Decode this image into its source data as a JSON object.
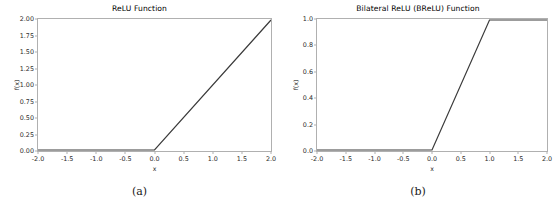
{
  "figure": {
    "background": "#ffffff",
    "line_color": "#3a3a3a",
    "axis_color": "#b0b0b0"
  },
  "panels": [
    {
      "caption": "(a)",
      "chart_data": {
        "type": "line",
        "title": "ReLU Function",
        "xlabel": "x",
        "ylabel": "f(x)",
        "xlim": [
          -2.0,
          2.0
        ],
        "ylim": [
          0.0,
          2.0
        ],
        "grid": false,
        "legend": "none",
        "xticks": [
          "-2.0",
          "-1.5",
          "-1.0",
          "-0.5",
          "0.0",
          "0.5",
          "1.0",
          "1.5",
          "2.0"
        ],
        "xtick_values": [
          -2.0,
          -1.5,
          -1.0,
          -0.5,
          0.0,
          0.5,
          1.0,
          1.5,
          2.0
        ],
        "yticks": [
          "0.00",
          "0.25",
          "0.50",
          "0.75",
          "1.00",
          "1.25",
          "1.50",
          "1.75",
          "2.00"
        ],
        "ytick_values": [
          0.0,
          0.25,
          0.5,
          0.75,
          1.0,
          1.25,
          1.5,
          1.75,
          2.0
        ],
        "series": [
          {
            "name": "ReLU",
            "x": [
              -2.0,
              -1.5,
              -1.0,
              -0.5,
              0.0,
              0.5,
              1.0,
              1.5,
              2.0
            ],
            "values": [
              0.0,
              0.0,
              0.0,
              0.0,
              0.0,
              0.5,
              1.0,
              1.5,
              2.0
            ]
          }
        ]
      }
    },
    {
      "caption": "(b)",
      "chart_data": {
        "type": "line",
        "title": "Bilateral ReLU (BReLU) Function",
        "xlabel": "x",
        "ylabel": "f(x)",
        "xlim": [
          -2.0,
          2.0
        ],
        "ylim": [
          0.0,
          1.0
        ],
        "grid": false,
        "legend": "none",
        "xticks": [
          "-2.0",
          "-1.5",
          "-1.0",
          "-0.5",
          "0.0",
          "0.5",
          "1.0",
          "1.5",
          "2.0"
        ],
        "xtick_values": [
          -2.0,
          -1.5,
          -1.0,
          -0.5,
          0.0,
          0.5,
          1.0,
          1.5,
          2.0
        ],
        "yticks": [
          "0.0",
          "0.2",
          "0.4",
          "0.6",
          "0.8",
          "1.0"
        ],
        "ytick_values": [
          0.0,
          0.2,
          0.4,
          0.6,
          0.8,
          1.0
        ],
        "series": [
          {
            "name": "BReLU",
            "x": [
              -2.0,
              -1.5,
              -1.0,
              -0.5,
              0.0,
              0.5,
              1.0,
              1.5,
              2.0
            ],
            "values": [
              0.0,
              0.0,
              0.0,
              0.0,
              0.0,
              0.5,
              1.0,
              1.0,
              1.0
            ]
          }
        ]
      }
    }
  ]
}
